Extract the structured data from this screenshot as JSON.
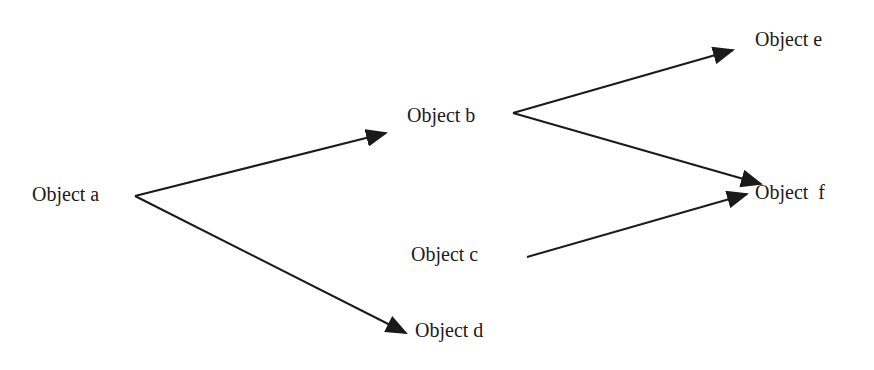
{
  "diagram": {
    "type": "directed-graph",
    "background": "#ffffff",
    "edge_color": "#1a1a1a",
    "nodes": [
      {
        "id": "a",
        "label": "Object a",
        "x": 32,
        "y": 184
      },
      {
        "id": "b",
        "label": "Object b",
        "x": 407,
        "y": 105
      },
      {
        "id": "c",
        "label": "Object c",
        "x": 411,
        "y": 244
      },
      {
        "id": "d",
        "label": "Object d",
        "x": 415,
        "y": 320
      },
      {
        "id": "e",
        "label": "Object e",
        "x": 755,
        "y": 29
      },
      {
        "id": "f",
        "label": "Object  f",
        "x": 755,
        "y": 182
      }
    ],
    "edges": [
      {
        "from": "a",
        "to": "b",
        "x1": 135,
        "y1": 196,
        "x2": 386,
        "y2": 133
      },
      {
        "from": "a",
        "to": "d",
        "x1": 135,
        "y1": 196,
        "x2": 406,
        "y2": 333
      },
      {
        "from": "b",
        "to": "e",
        "x1": 513,
        "y1": 113,
        "x2": 733,
        "y2": 50
      },
      {
        "from": "b",
        "to": "f",
        "x1": 513,
        "y1": 113,
        "x2": 761,
        "y2": 184
      },
      {
        "from": "c",
        "to": "f",
        "x1": 527,
        "y1": 257,
        "x2": 747,
        "y2": 194
      }
    ]
  }
}
